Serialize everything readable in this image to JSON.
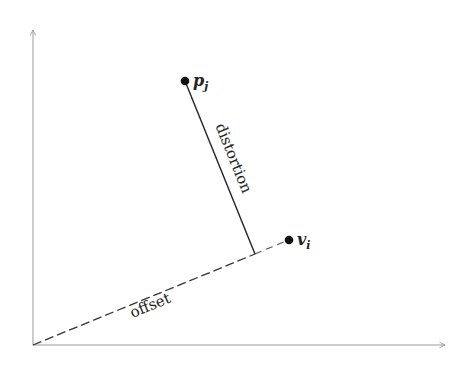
{
  "diagram": {
    "type": "vector-decomposition",
    "colors": {
      "axis": "#9a9a9a",
      "line": "#222222",
      "point": "#111111",
      "text": "#222222"
    },
    "axes": {
      "origin": [
        33,
        345
      ],
      "x_end": [
        445,
        345
      ],
      "y_end": [
        33,
        30
      ]
    },
    "points": [
      {
        "id": "p_j",
        "label_base": "p",
        "label_sub": "j",
        "pos": [
          185,
          81
        ]
      },
      {
        "id": "v_i",
        "label_base": "v",
        "label_sub": "i",
        "pos": [
          289,
          240
        ]
      }
    ],
    "foot": [
      255,
      254
    ],
    "segments": [
      {
        "id": "distortion",
        "label": "distortion",
        "style": "solid",
        "from": "p_j",
        "to": "foot"
      },
      {
        "id": "offset",
        "label": "offset",
        "style": "dashed",
        "from": "origin",
        "to": "foot"
      },
      {
        "id": "foot-to-v",
        "label": "",
        "style": "dashed",
        "from": "foot",
        "to": "v_i"
      }
    ]
  }
}
